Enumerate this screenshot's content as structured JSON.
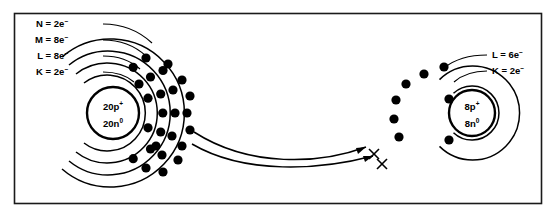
{
  "diagram": {
    "border_color": "#1a1a1a",
    "ink_color": "#000000",
    "background_color": "#ffffff"
  },
  "left_atom": {
    "name": "calcium-atom",
    "nucleus": {
      "protons_text": "20p",
      "protons_charge": "+",
      "neutrons_text": "20n",
      "neutrons_charge": "0"
    },
    "shells": [
      {
        "id": "K",
        "label": "K = 2e",
        "charge": "–",
        "electron_count": 2
      },
      {
        "id": "L",
        "label": "L = 8e",
        "charge": "–",
        "electron_count": 8
      },
      {
        "id": "M",
        "label": "M = 8e",
        "charge": "–",
        "electron_count": 8
      },
      {
        "id": "N",
        "label": "N = 2e",
        "charge": "–",
        "electron_count": 2
      }
    ]
  },
  "right_atom": {
    "name": "oxygen-atom",
    "nucleus": {
      "protons_text": "8p",
      "protons_charge": "+",
      "neutrons_text": "8n",
      "neutrons_charge": "0"
    },
    "shells": [
      {
        "id": "K",
        "label": "K = 2e",
        "charge": "–",
        "electron_count": 2
      },
      {
        "id": "L",
        "label": "L = 6e",
        "charge": "–",
        "electron_count": 6
      }
    ],
    "transferred_marks": 2
  },
  "transfer_arrows": {
    "name": "electron-transfer-arrows",
    "count": 2
  }
}
